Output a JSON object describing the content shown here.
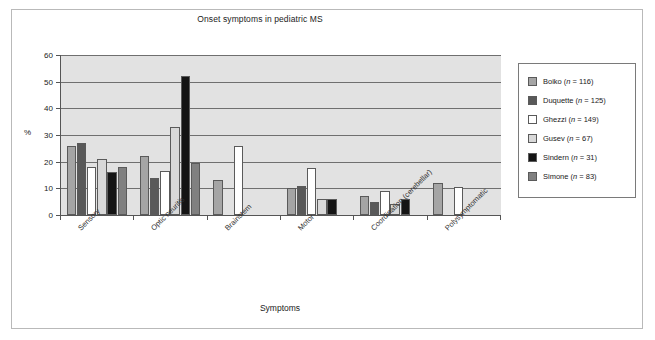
{
  "chart_data": {
    "type": "bar",
    "title": "Onset symptoms in pediatric MS",
    "xlabel": "Symptoms",
    "ylabel": "%",
    "ylim": [
      0,
      60
    ],
    "ytick_step": 10,
    "yticks": [
      "0",
      "10",
      "20",
      "30",
      "40",
      "50",
      "60"
    ],
    "grid": true,
    "legend_position": "right",
    "categories": [
      "Sensory",
      "Optic neuritis",
      "Brainstem",
      "Motor",
      "Coordination (cerebellar)",
      "Polysymptomatic"
    ],
    "series": [
      {
        "name": "Boiko",
        "n": 116,
        "legend_label": "Boiko (n = 116)",
        "color": "#a5a5a5",
        "values": [
          26,
          22,
          13,
          10.2,
          7,
          12
        ]
      },
      {
        "name": "Duquette",
        "n": 125,
        "legend_label": "Duquette (n = 125)",
        "color": "#595959",
        "values": [
          27,
          14,
          null,
          11,
          5,
          null
        ]
      },
      {
        "name": "Ghezzi",
        "n": 149,
        "legend_label": "Ghezzi (n = 149)",
        "color": "#ffffff",
        "values": [
          18,
          16.5,
          25.8,
          17.8,
          9,
          10.5
        ]
      },
      {
        "name": "Gusev",
        "n": 67,
        "legend_label": "Gusev (n = 67)",
        "color": "#d8d8d8",
        "values": [
          21,
          33,
          null,
          6,
          4.2,
          null
        ]
      },
      {
        "name": "Sindern",
        "n": 31,
        "legend_label": "Sindern (n = 31)",
        "color": "#141414",
        "values": [
          16,
          52,
          null,
          6,
          6,
          null
        ]
      },
      {
        "name": "Simone",
        "n": 83,
        "legend_label": "Simone (n = 83)",
        "color": "#808080",
        "values": [
          18,
          19.5,
          null,
          null,
          null,
          null
        ]
      }
    ]
  }
}
